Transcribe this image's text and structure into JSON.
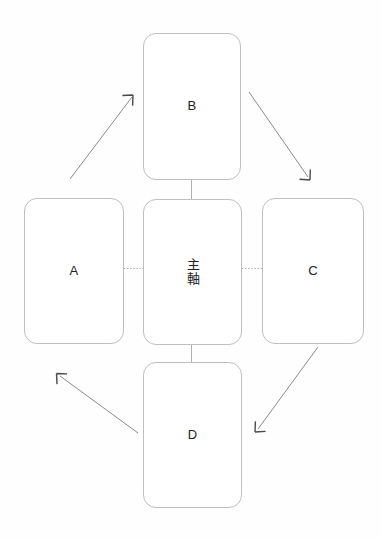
{
  "diagram": {
    "title": "",
    "background_color": "#fefefe",
    "node_border_color": "#bfbfbf",
    "node_fill_color": "#ffffff",
    "connector_color": "#b0b0b0",
    "arrow_color": "#888888",
    "label_color": "#222222",
    "nodes": {
      "center": {
        "label": "主軸",
        "orientation": "vertical"
      },
      "top": {
        "label": "B",
        "orientation": "horizontal"
      },
      "left": {
        "label": "A",
        "orientation": "horizontal"
      },
      "right": {
        "label": "C",
        "orientation": "horizontal"
      },
      "bottom": {
        "label": "D",
        "orientation": "horizontal"
      }
    },
    "connectors": [
      {
        "name": "center-to-top",
        "style": "solid",
        "from": "center",
        "to": "top"
      },
      {
        "name": "center-to-bottom",
        "style": "solid",
        "from": "center",
        "to": "bottom"
      },
      {
        "name": "center-to-left",
        "style": "dotted",
        "from": "center",
        "to": "left"
      },
      {
        "name": "center-to-right",
        "style": "dotted",
        "from": "center",
        "to": "right"
      }
    ],
    "arrows": [
      {
        "name": "arrow-a-to-b",
        "from": "A",
        "to": "B",
        "direction": "up-right"
      },
      {
        "name": "arrow-b-to-c",
        "from": "B",
        "to": "C",
        "direction": "down-right"
      },
      {
        "name": "arrow-c-to-d",
        "from": "C",
        "to": "D",
        "direction": "down-left"
      },
      {
        "name": "arrow-d-to-a",
        "from": "D",
        "to": "A",
        "direction": "up-left"
      }
    ]
  }
}
